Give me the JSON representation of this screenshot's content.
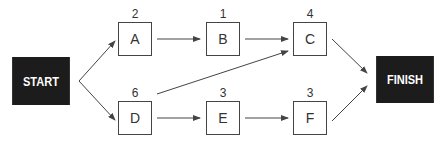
{
  "diagram": {
    "type": "activity-on-node network",
    "start_label": "START",
    "finish_label": "FINISH",
    "nodes": [
      {
        "id": "A",
        "label": "A",
        "duration": "2"
      },
      {
        "id": "B",
        "label": "B",
        "duration": "1"
      },
      {
        "id": "C",
        "label": "C",
        "duration": "4"
      },
      {
        "id": "D",
        "label": "D",
        "duration": "6"
      },
      {
        "id": "E",
        "label": "E",
        "duration": "3"
      },
      {
        "id": "F",
        "label": "F",
        "duration": "3"
      }
    ],
    "edges": [
      [
        "START",
        "A"
      ],
      [
        "START",
        "D"
      ],
      [
        "A",
        "B"
      ],
      [
        "B",
        "C"
      ],
      [
        "D",
        "C"
      ],
      [
        "D",
        "E"
      ],
      [
        "E",
        "F"
      ],
      [
        "C",
        "FINISH"
      ],
      [
        "F",
        "FINISH"
      ]
    ],
    "colors": {
      "terminal_bg": "#1c1c1c",
      "terminal_text": "#ffffff",
      "line": "#444444"
    }
  }
}
